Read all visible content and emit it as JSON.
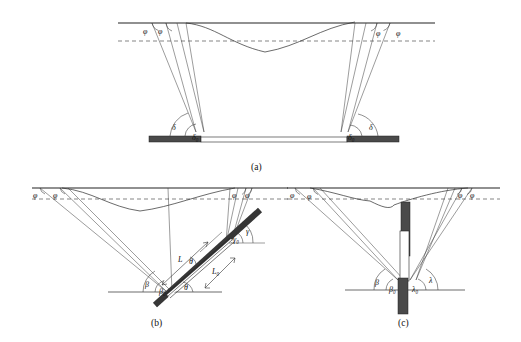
{
  "figure": {
    "title_caption_a": "(a)",
    "title_caption_b": "(b)",
    "title_caption_c": "(c)"
  },
  "panels": [
    {
      "id": "a",
      "caption": "(a)",
      "surface_labels": [
        "φ",
        "φ",
        "φ",
        "φ"
      ],
      "base_angle_labels": [
        "δ",
        "δ₀",
        "δ₀",
        "δ"
      ],
      "elements": {
        "ground_line": "ground-surface-line",
        "dashed_line": "reference-dashed-line",
        "settlement_curve": "settlement-trough-curve",
        "base_bar_left": "dark-base-bar-left",
        "base_bar_right": "dark-base-bar-right",
        "base_bar_center": "hollow-base-bar-center"
      }
    },
    {
      "id": "b",
      "caption": "(b)",
      "surface_labels": [
        "φ",
        "φ",
        "φ",
        "φ"
      ],
      "left_angle_labels": [
        "β",
        "β₀"
      ],
      "right_angle_labels": [
        "γ₀",
        "γ"
      ],
      "inclined_angle_label": "θ",
      "length_labels": [
        "L",
        "L₀"
      ],
      "elements": {
        "ground_line": "ground-surface-line",
        "dashed_line": "reference-dashed-line",
        "settlement_curve": "settlement-trough-curve",
        "inclined_pile": "inclined-pile-bar",
        "inclined_pile_inner": "inclined-pile-inner-bar",
        "base_line": "lower-base-line"
      }
    },
    {
      "id": "c",
      "caption": "(c)",
      "surface_labels": [
        "φ",
        "φ",
        "φ",
        "φ"
      ],
      "left_angle_labels": [
        "β",
        "β₀"
      ],
      "right_angle_labels": [
        "λ₀",
        "λ"
      ],
      "elements": {
        "ground_line": "ground-surface-line",
        "dashed_line": "reference-dashed-line",
        "settlement_curve": "settlement-trough-curve",
        "vertical_pile_upper": "vertical-pile-upper-dark",
        "vertical_pile_middle": "vertical-pile-middle-hollow",
        "vertical_pile_lower": "vertical-pile-lower-dark",
        "base_line": "lower-base-line"
      }
    }
  ],
  "symbols": {
    "phi": "φ",
    "delta": "δ",
    "delta_zero": "δ₀",
    "beta": "β",
    "beta_zero": "β₀",
    "gamma": "γ",
    "gamma_zero": "γ₀",
    "lambda": "λ",
    "lambda_zero": "λ₀",
    "theta": "θ",
    "L": "L",
    "L_zero": "L₀"
  }
}
